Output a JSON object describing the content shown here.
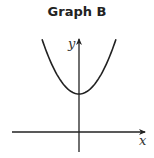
{
  "chart_data": {
    "type": "line",
    "title": "Graph B",
    "xlabel": "x",
    "ylabel": "y",
    "grid": false,
    "ticks": false,
    "legend": null,
    "note": "Axes have no ticks or numeric labels; numeric values are an assumed normalization of the drawn shape (upward parabola, vertex above x-axis on y-axis), not values read from the image.",
    "series": [
      {
        "name": "curve",
        "description": "upward-opening parabola, vertex on positive y-axis",
        "equation_estimate": "y = x^2 + 1",
        "x": [
          -1.2,
          -0.9,
          -0.6,
          -0.3,
          0,
          0.3,
          0.6,
          0.9,
          1.2
        ],
        "y": [
          2.44,
          1.81,
          1.36,
          1.09,
          1.0,
          1.09,
          1.36,
          1.81,
          2.44
        ]
      }
    ],
    "xlim": [
      -2,
      2
    ],
    "ylim": [
      -0.6,
      2.6
    ]
  },
  "graph": {
    "title": "Graph B",
    "x_axis_label": "x",
    "y_axis_label": "y"
  },
  "colors": {
    "curve": "#222222",
    "axes": "#222222",
    "background": "#ffffff"
  }
}
